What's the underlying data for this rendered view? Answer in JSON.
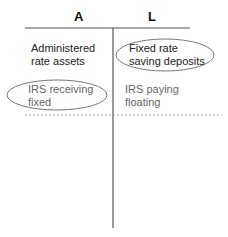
{
  "diagram": {
    "type": "t-account",
    "headers": {
      "assets": "A",
      "liabilities": "L"
    },
    "assets": [
      {
        "lines": [
          "Administered",
          "rate assets"
        ],
        "circled": false,
        "emphasis": "dark"
      },
      {
        "lines": [
          "IRS receiving",
          "fixed"
        ],
        "circled": true,
        "emphasis": "gray"
      }
    ],
    "liabilities": [
      {
        "lines": [
          "Fixed rate",
          "saving deposits"
        ],
        "circled": true,
        "emphasis": "dark"
      },
      {
        "lines": [
          "IRS paying",
          "floating"
        ],
        "circled": false,
        "emphasis": "gray"
      }
    ],
    "colors": {
      "line": "#555555",
      "dashed": "#aaaaaa",
      "ellipse": "#777777",
      "text_dark": "#222222",
      "text_gray": "#666666"
    }
  }
}
